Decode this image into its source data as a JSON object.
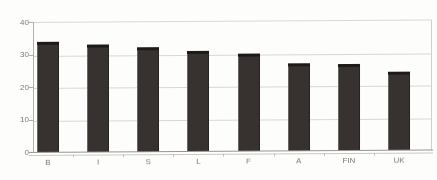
{
  "figure": {
    "background": "#fdfdfc"
  },
  "chart_data": {
    "type": "bar",
    "title": "",
    "xlabel": "",
    "ylabel": "",
    "categories": [
      "B",
      "I",
      "S",
      "L",
      "F",
      "A",
      "FIN",
      "UK"
    ],
    "values": [
      33,
      32,
      31,
      30,
      29,
      26,
      25.5,
      23
    ],
    "ylim": [
      0,
      40
    ],
    "yticks": [
      0,
      10,
      20,
      30,
      40
    ],
    "grid": "horizontal",
    "legend": "none",
    "colors": {
      "bar_front": "#37312f",
      "bar_top": "#1e1a19",
      "bar_highlight": "#6b6667",
      "gridline": "#d8d7d2",
      "axis": "#a9a8a2",
      "tick_label": "#7b7a76",
      "background": "#fdfdfc"
    }
  }
}
